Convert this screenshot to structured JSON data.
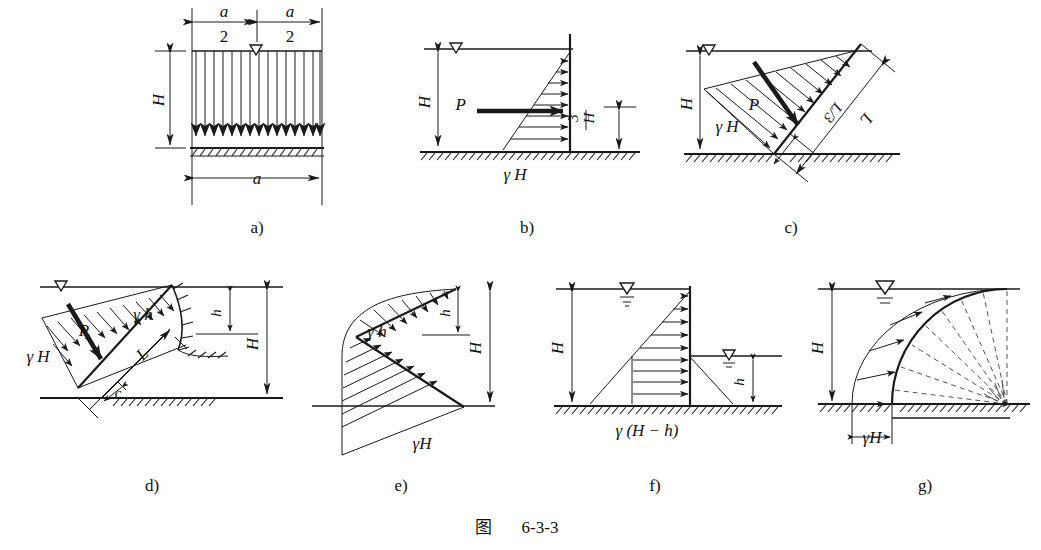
{
  "figure": {
    "caption_cn": "图",
    "caption_number": "6-3-3",
    "kind": "engineering-pressure-diagram-set"
  },
  "colors": {
    "ink": "#1a1a1a",
    "paper": "#ffffff",
    "dash": "#555555"
  },
  "panels": [
    {
      "id": "a",
      "sub_label": "a)",
      "labels": {
        "half_width_left_num": "a",
        "half_width_left_den": "2",
        "half_width_right_num": "a",
        "half_width_right_den": "2",
        "height": "H",
        "base_width": "a"
      },
      "icons": [
        "water-table-icon",
        "ground-hatch-icon",
        "down-arrow-load"
      ],
      "arrow_count": 15,
      "description": "Uniform vertical load of width a and depth H over hatched ground"
    },
    {
      "id": "b",
      "sub_label": "b)",
      "labels": {
        "height": "H",
        "resultant": "P",
        "base_pressure": "γ H",
        "lever_arm_num": "H",
        "lever_arm_den": "3"
      },
      "icons": [
        "water-table-icon",
        "ground-hatch-icon",
        "pressure-arrow"
      ],
      "arrow_count": 8,
      "description": "Triangular hydrostatic pressure on a vertical wall, resultant P at H/3"
    },
    {
      "id": "c",
      "sub_label": "c)",
      "labels": {
        "height": "H",
        "base_pressure": "γ H",
        "resultant": "P",
        "lever_arm": "L/3",
        "length": "L"
      },
      "icons": [
        "water-table-icon",
        "ground-hatch-icon",
        "pressure-arrow"
      ],
      "arrow_count": 10,
      "description": "Triangular pressure normal to an inclined wall of length L, resultant P at L/3"
    },
    {
      "id": "d",
      "sub_label": "d)",
      "labels": {
        "height": "H",
        "small_head": "h",
        "top_pressure": "γ h",
        "base_pressure": "γ H",
        "resultant": "P",
        "length": "L",
        "chord": "c"
      },
      "icons": [
        "water-table-icon",
        "ground-hatch-icon",
        "curved-wall-hatch-icon",
        "pressure-arrow"
      ],
      "arrow_count": 11,
      "description": "Trapezoidal pressure on an inclined wall with curved toe; depths h and H"
    },
    {
      "id": "e",
      "sub_label": "e)",
      "labels": {
        "height": "H",
        "small_head": "h",
        "top_pressure": "γ h",
        "base_pressure": "γH"
      },
      "icons": [
        "pressure-arrow"
      ],
      "arrow_count": 14,
      "description": "Pressure normal to a broken (two-slope) wall face, heads h and H"
    },
    {
      "id": "f",
      "sub_label": "f)",
      "labels": {
        "height": "H",
        "small_head": "h",
        "net_pressure": "γ (H − h)"
      },
      "icons": [
        "water-table-icon",
        "water-table-icon",
        "ground-hatch-icon",
        "pressure-arrow"
      ],
      "arrow_count": 9,
      "description": "Net differential water pressure on a wall with water on both sides, H and h"
    },
    {
      "id": "g",
      "sub_label": "g)",
      "labels": {
        "height": "H",
        "base_pressure": "γH"
      },
      "icons": [
        "water-table-icon",
        "ground-hatch-icon",
        "pressure-arrow",
        "radial-dashed-icon"
      ],
      "arrow_count": 5,
      "description": "Radial pressure normal to a curved (circular arc) wall, dashed radii to centre"
    }
  ]
}
